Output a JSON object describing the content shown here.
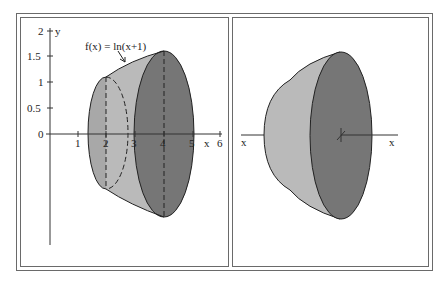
{
  "figure": {
    "left_panel": {
      "title": "Region under f(x) = ln(x+1) rotated about x-axis",
      "function_label": "f(x) = ln(x+1)",
      "x_axis_label": "x",
      "y_axis_label": "y",
      "x_ticks": [
        "1",
        "2",
        "3",
        "4",
        "5",
        "6"
      ],
      "y_ticks": [
        "0",
        "0.5",
        "1",
        "1.5",
        "2"
      ],
      "origin_label": "0",
      "cross_sections": [
        {
          "x": 2,
          "radius": "ln(3)",
          "style": "dashed back half"
        },
        {
          "x": 4,
          "radius": "ln(5)",
          "style": "filled face"
        }
      ]
    },
    "right_panel": {
      "title": "Solid of revolution view",
      "axis_label_left": "x",
      "axis_label_right": "x"
    },
    "colors": {
      "face_dark": "#767676",
      "surface_light": "#bababa",
      "surface_inner": "#a8a8a8",
      "outline": "#222222",
      "frame": "#6a6a6a"
    }
  }
}
